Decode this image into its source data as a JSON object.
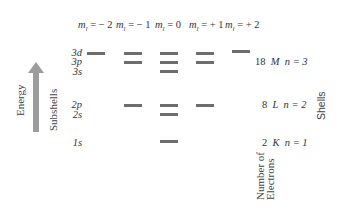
{
  "header": {
    "ml_prefix": "m",
    "ml_sub": "l",
    "columns": [
      {
        "value": "= − 2",
        "x": 78
      },
      {
        "value": "= − 1",
        "x": 116
      },
      {
        "value": "= 0",
        "x": 155
      },
      {
        "value": "= + 1",
        "x": 189
      },
      {
        "value": "= + 2",
        "x": 225
      }
    ]
  },
  "axis": {
    "energy_label": "Energy",
    "subshells_label": "Subshells",
    "shells_label": "Shells",
    "electrons_label_line1": "Number of",
    "electrons_label_line2": "Electrons"
  },
  "subshells": [
    {
      "label": "3d",
      "y": 53
    },
    {
      "label": "3p",
      "y": 62
    },
    {
      "label": "3s",
      "y": 72
    },
    {
      "label": "2p",
      "y": 105
    },
    {
      "label": "2s",
      "y": 115
    },
    {
      "label": "1s",
      "y": 143
    }
  ],
  "shells": [
    {
      "electrons": "18",
      "letter": "M",
      "n": "n = 3",
      "y": 62
    },
    {
      "electrons": "8",
      "letter": "L",
      "n": "n = 2",
      "y": 105
    },
    {
      "electrons": "2",
      "letter": "K",
      "n": "n = 1",
      "y": 143
    }
  ],
  "colors": {
    "bar": "#6d6d6d",
    "arrow": "#9c9c9c",
    "text": "#333333"
  }
}
